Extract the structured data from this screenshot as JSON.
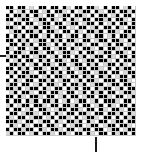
{
  "figure": {
    "background_color": "#ffffff",
    "width": 144,
    "height": 155
  },
  "axes": {
    "left_tick": {
      "name": "y-axis-tick",
      "position_px": 55,
      "color": "#1a1a1a",
      "label": ""
    },
    "bottom_tick": {
      "name": "x-axis-tick",
      "position_px": 95,
      "color": "#1a1a1a",
      "label": ""
    }
  },
  "chart_data": {
    "type": "heatmap",
    "title": "",
    "subtitle": "",
    "xlabel": "",
    "ylabel": "",
    "xtick_labels": [],
    "ytick_labels": [],
    "legend": [],
    "grid": true,
    "gridline_color": "#c9c9c9",
    "rows": 32,
    "cols": 32,
    "xlim": [
      0,
      32
    ],
    "ylim": [
      0,
      32
    ],
    "value_colors": {
      "0": "#000000",
      "1": "#ffffff",
      "2": "#d9d9d9"
    },
    "value_labels": {
      "0": "black",
      "1": "white",
      "2": "gray"
    },
    "values": [
      [
        0,
        0,
        1,
        0,
        0,
        1,
        2,
        1,
        0,
        0,
        1,
        0,
        0,
        1,
        0,
        2,
        1,
        0,
        0,
        1,
        0,
        0,
        2,
        1,
        0,
        1,
        0,
        0,
        1,
        2,
        0,
        1
      ],
      [
        1,
        0,
        1,
        2,
        0,
        1,
        0,
        0,
        1,
        2,
        0,
        1,
        0,
        0,
        2,
        1,
        0,
        1,
        2,
        0,
        0,
        1,
        0,
        2,
        1,
        0,
        0,
        1,
        0,
        0,
        2,
        0
      ],
      [
        0,
        1,
        0,
        0,
        2,
        0,
        1,
        0,
        2,
        1,
        0,
        0,
        1,
        2,
        0,
        0,
        1,
        0,
        0,
        2,
        1,
        0,
        1,
        0,
        0,
        1,
        2,
        0,
        1,
        0,
        0,
        1
      ],
      [
        0,
        0,
        1,
        2,
        0,
        0,
        1,
        2,
        0,
        0,
        1,
        0,
        2,
        1,
        0,
        1,
        0,
        2,
        1,
        0,
        0,
        1,
        0,
        0,
        2,
        0,
        1,
        0,
        0,
        2,
        1,
        0
      ],
      [
        2,
        1,
        0,
        0,
        1,
        0,
        0,
        1,
        2,
        0,
        0,
        1,
        0,
        0,
        1,
        2,
        0,
        0,
        1,
        2,
        0,
        0,
        1,
        0,
        1,
        2,
        0,
        1,
        0,
        0,
        1,
        0
      ],
      [
        0,
        0,
        2,
        1,
        0,
        1,
        2,
        0,
        1,
        0,
        0,
        2,
        1,
        0,
        0,
        1,
        2,
        1,
        0,
        0,
        1,
        2,
        0,
        1,
        0,
        0,
        1,
        0,
        2,
        1,
        0,
        0
      ],
      [
        1,
        2,
        0,
        0,
        1,
        0,
        0,
        2,
        0,
        1,
        0,
        0,
        2,
        1,
        0,
        0,
        1,
        0,
        2,
        1,
        0,
        0,
        2,
        0,
        1,
        0,
        0,
        2,
        1,
        0,
        0,
        1
      ],
      [
        0,
        1,
        0,
        2,
        0,
        1,
        0,
        0,
        1,
        2,
        0,
        1,
        0,
        0,
        1,
        2,
        0,
        0,
        1,
        0,
        2,
        1,
        0,
        0,
        1,
        2,
        0,
        1,
        0,
        0,
        2,
        0
      ],
      [
        0,
        0,
        1,
        0,
        2,
        0,
        1,
        2,
        0,
        0,
        1,
        0,
        2,
        0,
        1,
        0,
        0,
        2,
        1,
        0,
        0,
        1,
        2,
        0,
        0,
        1,
        0,
        0,
        2,
        1,
        0,
        1
      ],
      [
        1,
        0,
        0,
        1,
        0,
        2,
        0,
        1,
        0,
        0,
        2,
        1,
        0,
        1,
        0,
        2,
        1,
        0,
        0,
        2,
        1,
        0,
        0,
        1,
        2,
        0,
        1,
        0,
        0,
        1,
        2,
        0
      ],
      [
        0,
        2,
        1,
        0,
        0,
        1,
        2,
        0,
        1,
        0,
        0,
        1,
        2,
        0,
        0,
        1,
        0,
        2,
        1,
        0,
        0,
        2,
        1,
        0,
        1,
        0,
        0,
        2,
        1,
        0,
        0,
        1
      ],
      [
        0,
        1,
        0,
        0,
        2,
        1,
        0,
        0,
        2,
        1,
        0,
        0,
        1,
        2,
        0,
        0,
        2,
        1,
        0,
        1,
        0,
        0,
        1,
        2,
        0,
        0,
        1,
        0,
        0,
        2,
        1,
        0
      ],
      [
        2,
        0,
        0,
        1,
        0,
        0,
        1,
        2,
        0,
        0,
        1,
        2,
        0,
        1,
        0,
        0,
        1,
        0,
        2,
        0,
        1,
        2,
        0,
        0,
        1,
        0,
        2,
        1,
        0,
        0,
        1,
        0
      ],
      [
        0,
        1,
        2,
        0,
        1,
        0,
        0,
        1,
        0,
        2,
        0,
        1,
        0,
        0,
        2,
        1,
        0,
        0,
        1,
        2,
        0,
        0,
        1,
        0,
        0,
        2,
        1,
        0,
        1,
        0,
        0,
        2
      ],
      [
        1,
        0,
        0,
        2,
        0,
        1,
        2,
        0,
        1,
        0,
        0,
        2,
        1,
        0,
        0,
        1,
        2,
        0,
        0,
        1,
        0,
        2,
        0,
        1,
        2,
        0,
        0,
        1,
        0,
        2,
        1,
        0
      ],
      [
        0,
        0,
        1,
        0,
        2,
        0,
        1,
        0,
        0,
        2,
        1,
        0,
        0,
        1,
        2,
        0,
        1,
        2,
        0,
        0,
        1,
        0,
        0,
        2,
        1,
        0,
        1,
        0,
        2,
        0,
        0,
        1
      ],
      [
        0,
        2,
        0,
        1,
        0,
        0,
        2,
        1,
        0,
        0,
        1,
        0,
        2,
        0,
        1,
        0,
        0,
        1,
        2,
        0,
        0,
        1,
        2,
        0,
        0,
        1,
        0,
        0,
        1,
        2,
        0,
        0
      ],
      [
        1,
        0,
        1,
        0,
        0,
        2,
        0,
        0,
        1,
        2,
        0,
        1,
        0,
        0,
        2,
        1,
        0,
        0,
        1,
        0,
        2,
        0,
        1,
        0,
        2,
        0,
        1,
        2,
        0,
        0,
        1,
        0
      ],
      [
        0,
        1,
        0,
        2,
        1,
        0,
        0,
        1,
        0,
        0,
        2,
        0,
        1,
        2,
        0,
        0,
        1,
        2,
        0,
        1,
        0,
        0,
        2,
        1,
        0,
        0,
        0,
        1,
        0,
        0,
        2,
        1
      ],
      [
        2,
        0,
        0,
        1,
        0,
        0,
        1,
        2,
        0,
        1,
        0,
        0,
        2,
        1,
        0,
        1,
        0,
        0,
        2,
        0,
        1,
        2,
        0,
        0,
        1,
        2,
        0,
        0,
        1,
        0,
        0,
        1
      ],
      [
        0,
        0,
        2,
        0,
        1,
        2,
        0,
        0,
        1,
        0,
        2,
        1,
        0,
        0,
        1,
        0,
        2,
        0,
        1,
        0,
        0,
        1,
        0,
        2,
        0,
        0,
        1,
        2,
        0,
        1,
        0,
        0
      ],
      [
        1,
        2,
        0,
        1,
        0,
        0,
        2,
        1,
        0,
        0,
        1,
        0,
        0,
        2,
        1,
        0,
        0,
        1,
        2,
        0,
        1,
        0,
        2,
        0,
        1,
        0,
        0,
        1,
        2,
        0,
        0,
        2
      ],
      [
        0,
        0,
        1,
        0,
        2,
        1,
        0,
        0,
        2,
        1,
        0,
        0,
        1,
        2,
        0,
        1,
        0,
        0,
        1,
        2,
        0,
        0,
        1,
        0,
        0,
        2,
        1,
        0,
        0,
        1,
        2,
        0
      ],
      [
        0,
        1,
        0,
        0,
        1,
        0,
        2,
        0,
        1,
        0,
        0,
        2,
        0,
        1,
        2,
        0,
        1,
        2,
        0,
        0,
        1,
        2,
        0,
        1,
        0,
        0,
        0,
        2,
        1,
        0,
        0,
        1
      ],
      [
        2,
        0,
        1,
        2,
        0,
        0,
        1,
        0,
        0,
        2,
        1,
        0,
        0,
        1,
        0,
        0,
        2,
        0,
        1,
        0,
        0,
        1,
        2,
        0,
        1,
        0,
        2,
        1,
        0,
        0,
        1,
        0
      ],
      [
        0,
        1,
        0,
        0,
        1,
        2,
        0,
        1,
        0,
        0,
        2,
        1,
        2,
        0,
        0,
        1,
        0,
        0,
        2,
        1,
        0,
        0,
        1,
        0,
        2,
        1,
        0,
        0,
        2,
        1,
        0,
        0
      ],
      [
        1,
        0,
        0,
        1,
        2,
        0,
        0,
        2,
        1,
        0,
        0,
        1,
        0,
        2,
        1,
        0,
        0,
        1,
        0,
        0,
        2,
        1,
        0,
        0,
        1,
        0,
        0,
        2,
        0,
        1,
        0,
        2
      ],
      [
        0,
        2,
        1,
        0,
        0,
        1,
        2,
        0,
        0,
        1,
        2,
        0,
        1,
        0,
        0,
        2,
        1,
        0,
        1,
        2,
        0,
        0,
        2,
        1,
        0,
        0,
        1,
        0,
        1,
        0,
        2,
        0
      ],
      [
        0,
        0,
        0,
        2,
        1,
        0,
        0,
        1,
        2,
        0,
        0,
        1,
        0,
        2,
        1,
        0,
        0,
        2,
        0,
        1,
        0,
        2,
        1,
        0,
        0,
        1,
        2,
        0,
        0,
        1,
        0,
        0
      ],
      [
        1,
        0,
        2,
        1,
        0,
        2,
        1,
        0,
        0,
        1,
        0,
        0,
        2,
        1,
        0,
        1,
        2,
        0,
        0,
        1,
        2,
        0,
        0,
        1,
        2,
        0,
        0,
        1,
        0,
        0,
        2,
        1
      ],
      [
        0,
        1,
        0,
        0,
        2,
        0,
        0,
        1,
        0,
        2,
        1,
        0,
        0,
        2,
        1,
        0,
        0,
        1,
        2,
        0,
        0,
        1,
        0,
        0,
        1,
        2,
        0,
        0,
        1,
        2,
        0,
        0
      ],
      [
        2,
        0,
        1,
        0,
        0,
        1,
        2,
        0,
        1,
        0,
        0,
        2,
        1,
        0,
        0,
        2,
        1,
        0,
        0,
        1,
        0,
        2,
        1,
        0,
        0,
        1,
        0,
        2,
        0,
        0,
        1,
        0
      ]
    ]
  }
}
